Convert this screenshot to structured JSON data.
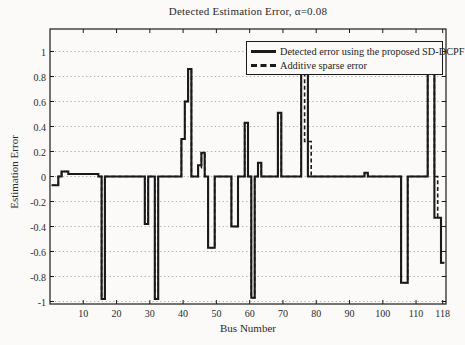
{
  "chart_data": {
    "type": "line",
    "subtype": "stairs",
    "title": "Detected Estimation Error, α=0.08",
    "xlabel": "Bus Number",
    "ylabel": "Estimation Error",
    "xlim": [
      0,
      119
    ],
    "ylim": [
      -1.02,
      1.18
    ],
    "xticks": [
      10,
      20,
      30,
      40,
      50,
      60,
      70,
      80,
      90,
      100,
      110,
      118
    ],
    "yticks": [
      -1,
      -0.8,
      -0.6,
      -0.4,
      -0.2,
      0,
      0.2,
      0.4,
      0.6,
      0.8,
      1
    ],
    "grid": "horizontal-dotted",
    "legend_position": "top-right-inside",
    "line_color": "#1a1a1a",
    "background_color": "#fbfaf8",
    "bus_range": [
      1,
      118
    ],
    "baseline_value": 0,
    "series": [
      {
        "name": "Detected error using the proposed SD-DCPF",
        "style": "solid",
        "values_by_bus": {
          "1": -0.07,
          "2": -0.07,
          "4": 0.04,
          "5": 0.04,
          "6": 0.02,
          "7": 0.02,
          "8": 0.02,
          "9": 0.02,
          "10": 0.02,
          "11": 0.02,
          "12": 0.02,
          "13": 0.02,
          "14": 0.02,
          "16": -0.98,
          "29": -0.38,
          "32": -0.98,
          "40": 0.3,
          "41": 0.6,
          "42": 0.86,
          "45": 0.09,
          "46": 0.19,
          "48": -0.57,
          "49": -0.57,
          "55": -0.4,
          "56": -0.4,
          "59": 0.43,
          "61": -0.97,
          "63": 0.11,
          "69": 0.51,
          "76": 0.87,
          "77": 0.87,
          "95": 0.03,
          "106": -0.85,
          "107": -0.85,
          "114": 0.85,
          "115": 0.85,
          "116": -0.33,
          "117": -0.33,
          "118": -0.69
        }
      },
      {
        "name": "Additive sparse  error",
        "style": "dashed",
        "values_by_bus": {
          "1": -0.07,
          "2": -0.07,
          "4": 0.04,
          "5": 0.04,
          "6": 0.02,
          "7": 0.02,
          "8": 0.02,
          "9": 0.02,
          "10": 0.02,
          "11": 0.02,
          "12": 0.02,
          "13": 0.02,
          "14": 0.02,
          "16": -0.98,
          "29": -0.38,
          "32": -0.98,
          "40": 0.3,
          "41": 0.6,
          "42": 0.86,
          "45": 0.07,
          "46": 0.19,
          "48": -0.57,
          "49": -0.57,
          "55": -0.4,
          "56": -0.4,
          "59": 0.43,
          "61": -0.97,
          "63": 0.11,
          "69": 0.51,
          "76": 0.87,
          "77": 0.28,
          "78": 0.28,
          "95": 0.03,
          "106": -0.85,
          "107": -0.85,
          "114": 0.85,
          "115": 0.85,
          "117": -0.33,
          "118": -0.69
        }
      }
    ]
  }
}
